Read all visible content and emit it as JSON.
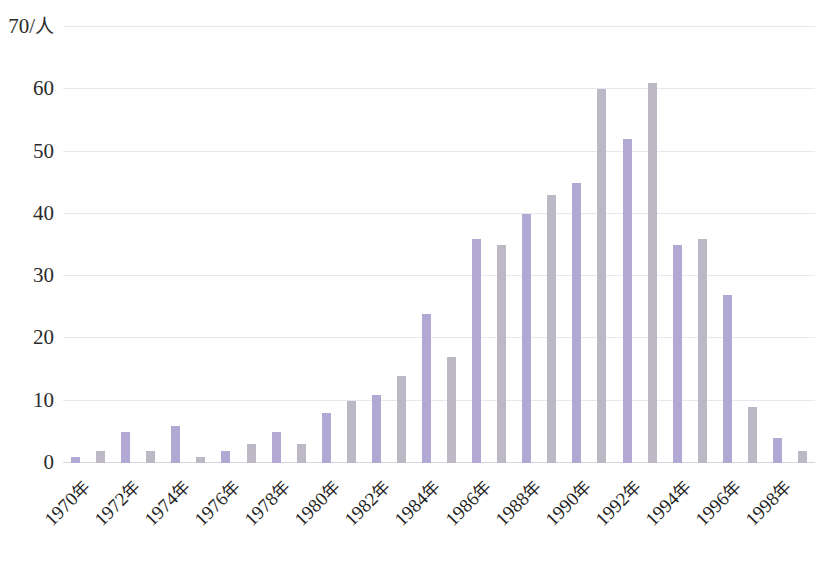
{
  "chart_data": {
    "type": "bar",
    "title": "",
    "subtitle": "",
    "xlabel": "",
    "ylabel": "70/人",
    "y_unit_label": "70/人",
    "ylim": [
      0,
      70
    ],
    "y_ticks": [
      0,
      10,
      20,
      30,
      40,
      50,
      60,
      70
    ],
    "y_tick_labels": [
      "0",
      "10",
      "20",
      "30",
      "40",
      "50",
      "60",
      "70/人"
    ],
    "grid": true,
    "grid_axis": "y",
    "legend": false,
    "legend_position": "none",
    "bar_colors": {
      "purple": "#b2a8d4",
      "gray": "#bcb8c6"
    },
    "categories": [
      "1970",
      "1971",
      "1972",
      "1973",
      "1974",
      "1975",
      "1976",
      "1977",
      "1978",
      "1979",
      "1980",
      "1981",
      "1982",
      "1983",
      "1984",
      "1985",
      "1986",
      "1987",
      "1988",
      "1989",
      "1990",
      "1991",
      "1992",
      "1993",
      "1994",
      "1995",
      "1996",
      "1997",
      "1998",
      "1999"
    ],
    "x_tick_labels": [
      "1970年",
      "1972年",
      "1974年",
      "1976年",
      "1978年",
      "1980年",
      "1982年",
      "1984年",
      "1986年",
      "1988年",
      "1990年",
      "1992年",
      "1994年",
      "1996年",
      "1998年"
    ],
    "x_tick_indices": [
      0,
      2,
      4,
      6,
      8,
      10,
      12,
      14,
      16,
      18,
      20,
      22,
      24,
      26,
      28
    ],
    "values": [
      1,
      2,
      5,
      2,
      6,
      1,
      2,
      3,
      5,
      3,
      8,
      10,
      11,
      14,
      24,
      17,
      36,
      35,
      40,
      43,
      45,
      60,
      52,
      61,
      35,
      36,
      27,
      9,
      4,
      2
    ],
    "point_colors": [
      "purple",
      "gray",
      "purple",
      "gray",
      "purple",
      "gray",
      "purple",
      "gray",
      "purple",
      "gray",
      "purple",
      "gray",
      "purple",
      "gray",
      "purple",
      "gray",
      "purple",
      "gray",
      "purple",
      "gray",
      "purple",
      "gray",
      "purple",
      "gray",
      "purple",
      "gray",
      "purple",
      "gray",
      "purple",
      "gray"
    ],
    "max_value": 61,
    "max_category": "1993"
  }
}
